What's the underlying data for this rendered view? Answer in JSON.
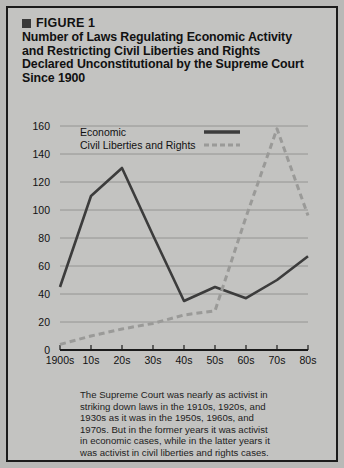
{
  "figure": {
    "label": "FIGURE 1",
    "title_lines": [
      "Number of Laws Regulating Economic Activity",
      "and Restricting Civil Liberties and Rights",
      "Declared Unconstitutional by the Supreme Court",
      "Since 1900"
    ],
    "caption_lines": [
      "The Supreme Court was nearly as activist in",
      "striking down laws in the 1910s, 1920s, and",
      "1930s as it was in the 1950s, 1960s, and",
      "1970s. But in the former years it was activist",
      "in economic cases, while in the latter years it",
      "was activist in civil liberties and rights cases."
    ]
  },
  "colors": {
    "card_background": "#c3c3c1",
    "page_background": "#b9b9b7",
    "border": "#1b1b1b",
    "text": "#111111",
    "economic_line": "#3c3c3c",
    "civil_line": "#9a9a98",
    "gridline": "#8e8e8c",
    "axis": "#1b1b1b"
  },
  "chart_data": {
    "type": "line",
    "title": "",
    "xlabel": "",
    "ylabel": "",
    "categories": [
      "1900s",
      "10s",
      "20s",
      "30s",
      "40s",
      "50s",
      "60s",
      "70s",
      "80s"
    ],
    "yticks": [
      0,
      20,
      40,
      60,
      80,
      100,
      120,
      140,
      160
    ],
    "ylim": [
      0,
      160
    ],
    "grid": true,
    "legend_position": "top-inside",
    "series": [
      {
        "name": "Economic",
        "style": "solid",
        "color": "#3c3c3c",
        "values": [
          45,
          110,
          130,
          82,
          35,
          45,
          37,
          50,
          67
        ]
      },
      {
        "name": "Civil Liberties and Rights",
        "style": "dashed",
        "color": "#9a9a98",
        "values": [
          4,
          10,
          15,
          19,
          25,
          28,
          95,
          158,
          96
        ]
      }
    ]
  }
}
